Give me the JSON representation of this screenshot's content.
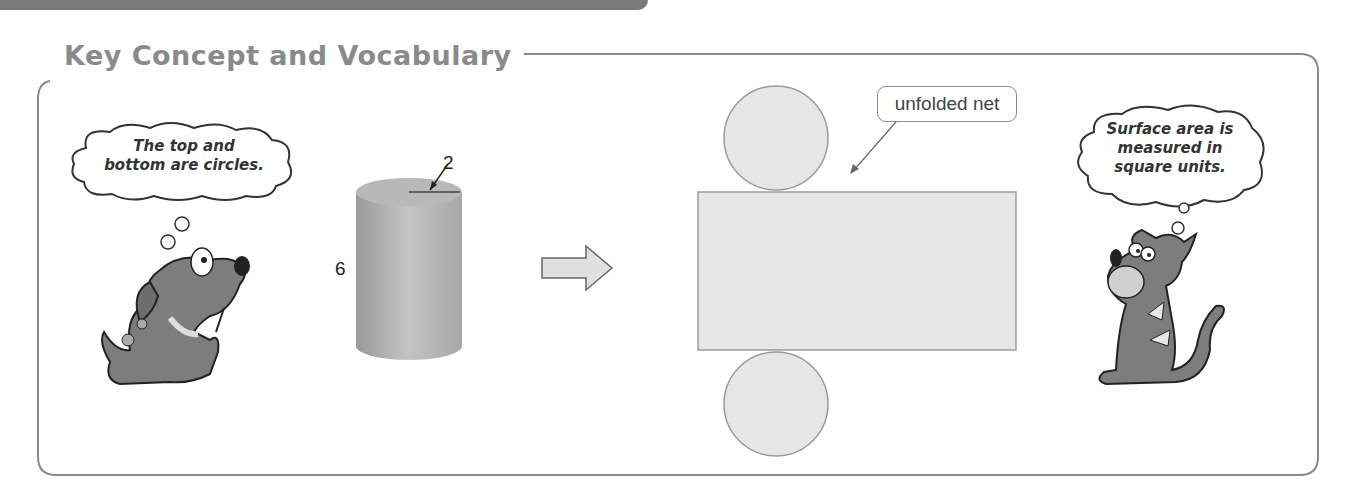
{
  "header": {
    "title": "Key Concept and Vocabulary"
  },
  "left_character": {
    "icon": "dog-icon",
    "thought": [
      "The top and",
      "bottom are circles."
    ]
  },
  "cylinder": {
    "radius_label": "2",
    "height_label": "6"
  },
  "transform_arrow": {
    "icon": "right-arrow-icon"
  },
  "net": {
    "callout_label": "unfolded net",
    "parts": [
      "top circle",
      "rectangle",
      "bottom circle"
    ]
  },
  "right_character": {
    "icon": "cat-icon",
    "thought": [
      "Surface area is",
      "measured in",
      "square units."
    ]
  },
  "colors": {
    "frame": "#8a8a8a",
    "heading": "#8a8a8a",
    "shape_fill": "#e6e6e6",
    "shape_stroke": "#9a9a9a",
    "character_fill": "#7d7d7d"
  }
}
